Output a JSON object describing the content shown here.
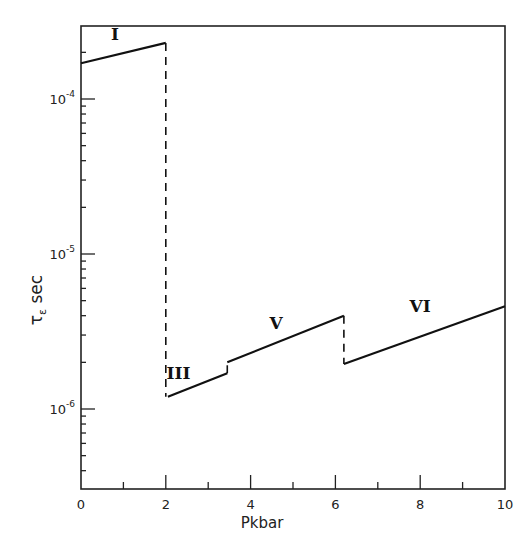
{
  "chart_data": {
    "type": "line",
    "title": "",
    "xlabel": "Pkbar",
    "ylabel": "τε sec",
    "ylabel_main": "τ",
    "ylabel_sub": "ε",
    "ylabel_unit": "sec",
    "xlim": [
      0,
      10
    ],
    "ylim": [
      3e-07,
      0.0003
    ],
    "yscale": "log",
    "grid": false,
    "x_ticks": [
      0,
      2,
      4,
      6,
      8,
      10
    ],
    "x_tick_labels": [
      "0",
      "2",
      "4",
      "6",
      "8",
      "10"
    ],
    "y_ticks": [
      1e-06,
      1e-05,
      0.0001
    ],
    "y_tick_labels": [
      {
        "base": "10",
        "exp": "-6"
      },
      {
        "base": "10",
        "exp": "-5"
      },
      {
        "base": "10",
        "exp": "-4"
      }
    ],
    "series": [
      {
        "name": "I",
        "x": [
          0,
          2.0
        ],
        "y": [
          0.00017,
          0.00023
        ],
        "style": "solid"
      },
      {
        "name": "III",
        "x": [
          2.05,
          3.45
        ],
        "y": [
          1.2e-06,
          1.7e-06
        ],
        "style": "solid"
      },
      {
        "name": "V",
        "x": [
          3.45,
          6.2
        ],
        "y": [
          2e-06,
          4e-06
        ],
        "style": "solid"
      },
      {
        "name": "VI",
        "x": [
          6.2,
          10
        ],
        "y": [
          1.95e-06,
          4.6e-06
        ],
        "style": "solid"
      }
    ],
    "transitions": [
      {
        "x": 2.0,
        "from": 0.00023,
        "to": 1.2e-06,
        "style": "dashed"
      },
      {
        "x": 3.45,
        "from": 1.7e-06,
        "to": 2e-06,
        "style": "dashed"
      },
      {
        "x": 6.2,
        "from": 4e-06,
        "to": 1.95e-06,
        "style": "dashed"
      }
    ],
    "annotations": [
      {
        "text": "I",
        "x": 0.8,
        "y": 0.00024
      },
      {
        "text": "III",
        "x": 2.3,
        "y": 1.55e-06
      },
      {
        "text": "V",
        "x": 4.6,
        "y": 3.3e-06
      },
      {
        "text": "VI",
        "x": 8.0,
        "y": 4.2e-06
      }
    ],
    "legend": null
  }
}
